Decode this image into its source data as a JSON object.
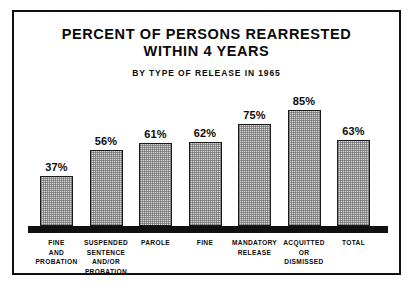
{
  "chart_data": {
    "type": "bar",
    "title": "PERCENT OF PERSONS REARRESTED WITHIN 4 YEARS",
    "title_lines": [
      "PERCENT OF PERSONS REARRESTED",
      "WITHIN 4 YEARS"
    ],
    "subtitle": "BY TYPE OF RELEASE IN 1965",
    "xlabel": "",
    "ylabel": "",
    "ylim": [
      0,
      100
    ],
    "grid": false,
    "legend": "none",
    "categories": [
      "FINE AND PROBATION",
      "SUSPENDED SENTENCE AND/OR PROBATION",
      "PAROLE",
      "FINE",
      "MANDATORY RELEASE",
      "ACQUITTED OR DISMISSED",
      "TOTAL"
    ],
    "category_lines": [
      [
        "FINE",
        "AND",
        "PROBATION"
      ],
      [
        "SUSPENDED",
        "SENTENCE",
        "AND/OR",
        "PROBATION"
      ],
      [
        "PAROLE"
      ],
      [
        "FINE"
      ],
      [
        "MANDATORY",
        "RELEASE"
      ],
      [
        "ACQUITTED",
        "OR",
        "DISMISSED"
      ],
      [
        "TOTAL"
      ]
    ],
    "values": [
      37,
      56,
      61,
      62,
      75,
      85,
      63
    ],
    "value_labels": [
      "37%",
      "56%",
      "61%",
      "62%",
      "75%",
      "85%",
      "63%"
    ],
    "colors": {
      "bar_fill": "#d8d8d8",
      "bar_stroke": "#1a1a1a",
      "text": "#0a0a0a",
      "baseline": "#111111",
      "frame": "#111111",
      "background": "#ffffff"
    }
  }
}
